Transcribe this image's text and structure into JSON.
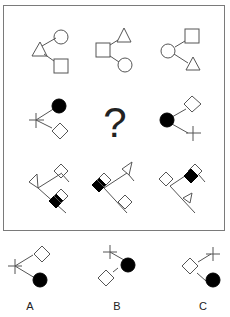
{
  "puzzle": {
    "question_mark": "?",
    "stroke_color": "#555555",
    "fill_black": "#000000",
    "frame_color": "#7a7a7a",
    "grid": [
      [
        {
          "cell": "r1c1",
          "center": "triangle",
          "branches": [
            "circle",
            "square"
          ]
        },
        {
          "cell": "r1c2",
          "center": "square",
          "branches": [
            "triangle",
            "circle"
          ]
        },
        {
          "cell": "r1c3",
          "center": "circle",
          "branches": [
            "square",
            "triangle"
          ]
        }
      ],
      [
        {
          "cell": "r2c1",
          "center": "cross",
          "branches": [
            "filled-circle",
            "diamond"
          ]
        },
        {
          "cell": "r2c2",
          "missing": true
        },
        {
          "cell": "r2c3",
          "center": "filled-circle",
          "branches": [
            "diamond",
            "cross"
          ]
        }
      ],
      [
        {
          "cell": "r3c1",
          "center": "triangle-flag",
          "branches": [
            "diamond-flag",
            "filled-diamond-pair"
          ]
        },
        {
          "cell": "r3c2",
          "center": "filled-diamond-pair",
          "branches": [
            "triangle-flag",
            "diamond-flag"
          ]
        },
        {
          "cell": "r3c3",
          "center": "diamond-flag",
          "branches": [
            "filled-diamond-pair",
            "triangle-flag"
          ]
        }
      ]
    ],
    "options": [
      {
        "label": "A",
        "center": "cross",
        "branches": [
          "diamond",
          "filled-circle"
        ]
      },
      {
        "label": "B",
        "center": "filled-circle",
        "branches": [
          "cross",
          "diamond"
        ]
      },
      {
        "label": "C",
        "center": "diamond",
        "branches": [
          "cross",
          "filled-circle"
        ]
      }
    ]
  }
}
